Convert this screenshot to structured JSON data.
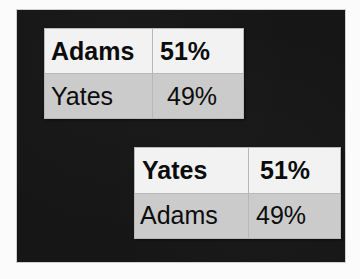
{
  "slide": {
    "background_color": "#161616",
    "page_background_color": "#fbfbfb"
  },
  "styles": {
    "leading_row_background": "#f2f2f2",
    "trailing_row_background": "#cbcbcb",
    "text_color": "#0c0c0c",
    "gridline_color": "#b8b8b8"
  },
  "tables": [
    {
      "id": "leader-adams",
      "rows": [
        {
          "name": "Adams",
          "percent": "51%",
          "state": "leading"
        },
        {
          "name": "Yates",
          "percent": "49%",
          "state": "trailing"
        }
      ]
    },
    {
      "id": "leader-yates",
      "rows": [
        {
          "name": "Yates",
          "percent": "51%",
          "state": "leading"
        },
        {
          "name": "Adams",
          "percent": "49%",
          "state": "trailing"
        }
      ]
    }
  ],
  "chart_data": {
    "type": "table",
    "title": "",
    "columns": [
      "Candidate",
      "Percent"
    ],
    "tables": [
      {
        "name": "poll-result-adams-leading",
        "categories": [
          "Adams",
          "Yates"
        ],
        "values": [
          51,
          49
        ],
        "value_labels": [
          "51%",
          "49%"
        ],
        "units": "percent",
        "highlighted_row": 0
      },
      {
        "name": "poll-result-yates-leading",
        "categories": [
          "Yates",
          "Adams"
        ],
        "values": [
          51,
          49
        ],
        "value_labels": [
          "51%",
          "49%"
        ],
        "units": "percent",
        "highlighted_row": 0
      }
    ]
  }
}
